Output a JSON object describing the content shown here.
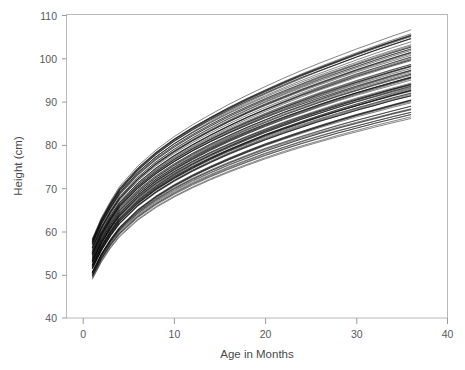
{
  "figure": {
    "background_color": "#ffffff",
    "plot_background_color": "#ffffff",
    "frame_color": "#b9b9bb",
    "line_color": "#0b0b0b"
  },
  "chart_data": {
    "type": "line",
    "title": "",
    "subtitle": "",
    "xlabel": "Age in Months",
    "ylabel": "Height (cm)",
    "xlim": [
      0,
      40
    ],
    "ylim": [
      40,
      110
    ],
    "xticks": [
      0,
      10,
      20,
      30,
      40
    ],
    "yticks": [
      40,
      50,
      60,
      70,
      80,
      90,
      100,
      110
    ],
    "xtick_labels": [
      "0",
      "10",
      "20",
      "30",
      "40"
    ],
    "ytick_labels": [
      "40",
      "50",
      "60",
      "70",
      "80",
      "90",
      "100",
      "110"
    ],
    "grid": false,
    "legend": null,
    "legend_position": "none",
    "annotations": [],
    "series_count": 90,
    "x_data_range": [
      1,
      36
    ],
    "y_data_range_at_start": [
      49,
      58.5
    ],
    "y_data_range_at_end": [
      85,
      106
    ],
    "x": [
      1,
      2,
      3,
      4,
      6,
      8,
      10,
      12,
      14,
      16,
      18,
      20,
      22,
      24,
      26,
      28,
      30,
      32,
      34,
      36
    ],
    "series": [
      {
        "name": "subject-01",
        "values": [
          49.0,
          53.0,
          56.2,
          58.8,
          62.6,
          65.5,
          67.9,
          70.0,
          71.9,
          73.6,
          75.2,
          76.7,
          78.1,
          79.4,
          80.6,
          81.8,
          82.9,
          84.0,
          85.0,
          86.0
        ]
      },
      {
        "name": "subject-02",
        "values": [
          50.0,
          54.1,
          57.4,
          60.1,
          64.0,
          67.0,
          69.5,
          71.7,
          73.6,
          75.4,
          77.0,
          78.6,
          80.0,
          81.4,
          82.7,
          83.9,
          85.0,
          86.1,
          87.2,
          88.2
        ]
      },
      {
        "name": "subject-03",
        "values": [
          50.6,
          54.8,
          58.1,
          60.9,
          64.9,
          68.0,
          70.6,
          72.8,
          74.8,
          76.6,
          78.3,
          79.9,
          81.3,
          82.7,
          84.0,
          85.3,
          86.5,
          87.6,
          88.7,
          89.8
        ]
      },
      {
        "name": "subject-04",
        "values": [
          51.2,
          55.4,
          58.8,
          61.6,
          65.7,
          68.8,
          71.4,
          73.7,
          75.7,
          77.6,
          79.3,
          80.9,
          82.4,
          83.8,
          85.2,
          86.4,
          87.7,
          88.8,
          90.0,
          91.0
        ]
      },
      {
        "name": "subject-05",
        "values": [
          51.8,
          56.1,
          59.5,
          62.4,
          66.5,
          69.7,
          72.3,
          74.6,
          76.7,
          78.6,
          80.3,
          82.0,
          83.5,
          84.9,
          86.3,
          87.6,
          88.8,
          90.0,
          91.2,
          92.3
        ]
      },
      {
        "name": "subject-06",
        "values": [
          52.3,
          56.6,
          60.1,
          63.0,
          67.1,
          70.3,
          73.0,
          75.3,
          77.4,
          79.3,
          81.1,
          82.8,
          84.3,
          85.8,
          87.2,
          88.5,
          89.8,
          91.0,
          92.2,
          93.3
        ]
      },
      {
        "name": "subject-07",
        "values": [
          52.8,
          57.2,
          60.7,
          63.6,
          67.8,
          71.1,
          73.8,
          76.2,
          78.3,
          80.2,
          82.0,
          83.7,
          85.3,
          86.8,
          88.2,
          89.6,
          90.9,
          92.1,
          93.3,
          94.4
        ]
      },
      {
        "name": "subject-08",
        "values": [
          53.3,
          57.7,
          61.2,
          64.2,
          68.5,
          71.8,
          74.5,
          76.9,
          79.1,
          81.1,
          82.9,
          84.6,
          86.2,
          87.7,
          89.2,
          90.6,
          91.9,
          93.1,
          94.3,
          95.5
        ]
      },
      {
        "name": "subject-09",
        "values": [
          53.8,
          58.3,
          61.9,
          64.9,
          69.2,
          72.5,
          75.3,
          77.7,
          79.9,
          81.9,
          83.8,
          85.5,
          87.2,
          88.7,
          90.2,
          91.6,
          92.9,
          94.2,
          95.4,
          96.6
        ]
      },
      {
        "name": "subject-10",
        "values": [
          54.4,
          58.9,
          62.5,
          65.6,
          69.9,
          73.3,
          76.1,
          78.6,
          80.8,
          82.8,
          84.7,
          86.5,
          88.2,
          89.7,
          91.2,
          92.6,
          94.0,
          95.3,
          96.6,
          97.8
        ]
      },
      {
        "name": "subject-11",
        "values": [
          55.0,
          59.6,
          63.2,
          66.3,
          70.7,
          74.1,
          77.0,
          79.5,
          81.7,
          83.8,
          85.7,
          87.5,
          89.2,
          90.8,
          92.4,
          93.8,
          95.2,
          96.5,
          97.8,
          99.0
        ]
      },
      {
        "name": "subject-12",
        "values": [
          55.7,
          60.3,
          64.0,
          67.1,
          71.6,
          75.1,
          78.0,
          80.5,
          82.8,
          84.9,
          86.9,
          88.7,
          90.4,
          92.1,
          93.6,
          95.1,
          96.6,
          97.9,
          99.2,
          100.5
        ]
      },
      {
        "name": "subject-13",
        "values": [
          56.4,
          61.1,
          64.8,
          68.0,
          72.5,
          76.1,
          79.0,
          81.6,
          83.9,
          86.1,
          88.1,
          90.0,
          91.7,
          93.4,
          95.0,
          96.5,
          98.0,
          99.4,
          100.8,
          102.1
        ]
      },
      {
        "name": "subject-14",
        "values": [
          57.1,
          61.9,
          65.6,
          68.9,
          73.5,
          77.1,
          80.1,
          82.7,
          85.1,
          87.3,
          89.3,
          91.2,
          93.0,
          94.7,
          96.4,
          97.9,
          99.4,
          100.9,
          102.3,
          103.6
        ]
      },
      {
        "name": "subject-15",
        "values": [
          57.8,
          62.6,
          66.4,
          69.7,
          74.4,
          78.1,
          81.2,
          83.8,
          86.2,
          88.4,
          90.5,
          92.4,
          94.3,
          96.1,
          97.7,
          99.3,
          100.9,
          102.4,
          103.8,
          105.2
        ]
      },
      {
        "name": "subject-16",
        "values": [
          58.4,
          63.3,
          67.1,
          70.5,
          75.2,
          78.9,
          82.0,
          84.7,
          87.1,
          89.4,
          91.5,
          93.5,
          95.4,
          97.2,
          98.9,
          100.5,
          102.1,
          103.6,
          105.1,
          106.5
        ]
      }
    ]
  },
  "axes": {
    "x_axis": {
      "label": "Age in Months",
      "min": 0,
      "max": 40,
      "ticks": [
        0,
        10,
        20,
        30,
        40
      ]
    },
    "y_axis": {
      "label": "Height (cm)",
      "min": 40,
      "max": 110,
      "ticks": [
        40,
        50,
        60,
        70,
        80,
        90,
        100,
        110
      ]
    }
  }
}
